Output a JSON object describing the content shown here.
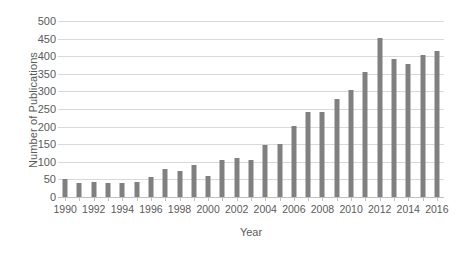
{
  "chart_data": {
    "type": "bar",
    "title": "",
    "xlabel": "Year",
    "ylabel": "Number of Publications",
    "ylim": [
      0,
      500
    ],
    "ytick_step": 50,
    "yticks": [
      0,
      50,
      100,
      150,
      200,
      250,
      300,
      350,
      400,
      450,
      500
    ],
    "ytick_labels": [
      "0",
      "50",
      "100",
      "150",
      "200",
      "250",
      "300",
      "350",
      "400",
      "450",
      "500"
    ],
    "grid": true,
    "grid_axis": "y",
    "legend": false,
    "legend_position": "none",
    "bar_color": "#808080",
    "gridline_color": "#d9d9d9",
    "text_color": "#5a5a5a",
    "background": "#ffffff",
    "xtick_interval": 2,
    "xtick_labels": [
      "1990",
      "1992",
      "1994",
      "1996",
      "1998",
      "2000",
      "2002",
      "2004",
      "2006",
      "2008",
      "2010",
      "2012",
      "2014",
      "2016"
    ],
    "categories": [
      "1990",
      "1991",
      "1992",
      "1993",
      "1994",
      "1995",
      "1996",
      "1997",
      "1998",
      "1999",
      "2000",
      "2001",
      "2002",
      "2003",
      "2004",
      "2005",
      "2006",
      "2007",
      "2008",
      "2009",
      "2010",
      "2011",
      "2012",
      "2013",
      "2014",
      "2015",
      "2016"
    ],
    "values": [
      52,
      40,
      43,
      40,
      39,
      43,
      56,
      81,
      75,
      90,
      61,
      104,
      110,
      104,
      148,
      152,
      201,
      241,
      241,
      278,
      305,
      355,
      453,
      393,
      377,
      403,
      414
    ]
  }
}
